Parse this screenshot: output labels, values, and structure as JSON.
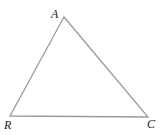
{
  "diagram": {
    "type": "triangle",
    "line_color": "#9a9a9a",
    "line_width": 1.3,
    "vertices": [
      {
        "name": "A",
        "x": 64,
        "y": 17,
        "label_x": 51,
        "label_y": 18
      },
      {
        "name": "R",
        "x": 10,
        "y": 116,
        "label_x": 4,
        "label_y": 129
      },
      {
        "name": "C",
        "x": 148,
        "y": 117,
        "label_x": 147,
        "label_y": 128
      }
    ]
  }
}
